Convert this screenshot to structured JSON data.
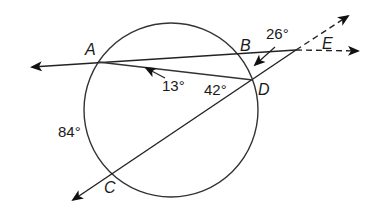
{
  "diagram": {
    "type": "circle-secants-geometry",
    "points": {
      "A": "A",
      "B": "B",
      "C": "C",
      "D": "D",
      "E": "E"
    },
    "angles": {
      "angle_AEC": "26°",
      "angle_DAB": "13°",
      "arc_AD_inscribed": "42°",
      "arc_AC": "84°"
    },
    "colors": {
      "stroke": "#222222",
      "background": "#ffffff"
    }
  }
}
